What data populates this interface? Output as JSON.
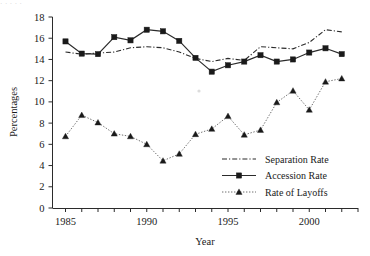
{
  "artifact": {
    "top_strip_text": "· ·                                                                    ·  ·                                                 ·"
  },
  "chart_data": {
    "type": "line",
    "title": "",
    "xlabel": "Year",
    "ylabel": "Percentages",
    "xlim": [
      1984.2,
      2003.0
    ],
    "ylim": [
      0,
      18
    ],
    "ytick_values": [
      0,
      2,
      4,
      6,
      8,
      10,
      12,
      14,
      16,
      18
    ],
    "ytick_labels": [
      "0",
      "2",
      "4",
      "6",
      "8",
      "10",
      "12",
      "14",
      "16",
      "18"
    ],
    "xtick_values": [
      1985,
      1986,
      1987,
      1988,
      1989,
      1990,
      1991,
      1992,
      1993,
      1994,
      1995,
      1996,
      1997,
      1998,
      1999,
      2000,
      2001,
      2002,
      2003
    ],
    "xtick_labels_shown": [
      {
        "value": 1985,
        "label": "1985"
      },
      {
        "value": 1990,
        "label": "1990"
      },
      {
        "value": 1995,
        "label": "1995"
      },
      {
        "value": 2000,
        "label": "2000"
      }
    ],
    "grid": false,
    "legend_position": "center-right",
    "x": [
      1985,
      1986,
      1987,
      1988,
      1989,
      1990,
      1991,
      1992,
      1993,
      1994,
      1995,
      1996,
      1997,
      1998,
      1999,
      2000,
      2001,
      2002
    ],
    "series": [
      {
        "name": "Separation Rate",
        "style": "dash-dot",
        "marker": "none",
        "color": "#2b2b2b",
        "values": [
          14.7,
          14.5,
          14.6,
          14.7,
          15.1,
          15.2,
          15.1,
          14.7,
          14.1,
          13.8,
          14.1,
          13.9,
          15.2,
          15.1,
          15.0,
          15.6,
          16.8,
          16.6
        ]
      },
      {
        "name": "Accession Rate",
        "style": "solid",
        "marker": "square",
        "color": "#1a1a1a",
        "values": [
          15.7,
          14.55,
          14.5,
          16.1,
          15.8,
          16.8,
          16.65,
          15.75,
          14.15,
          12.85,
          13.45,
          13.8,
          14.4,
          13.8,
          14.0,
          14.65,
          15.05,
          14.5
        ]
      },
      {
        "name": "Rate of Layoffs",
        "style": "dotted",
        "marker": "triangle",
        "color": "#6e6e6e",
        "values": [
          6.75,
          8.75,
          8.05,
          7.0,
          6.75,
          6.0,
          4.45,
          5.1,
          6.95,
          7.45,
          8.65,
          6.9,
          7.35,
          9.95,
          11.05,
          9.25,
          11.9,
          12.2
        ]
      }
    ]
  },
  "legend": {
    "items": [
      {
        "label": "Separation Rate",
        "style": "dash-dot",
        "marker": "none"
      },
      {
        "label": "Accession Rate",
        "style": "solid",
        "marker": "square"
      },
      {
        "label": "Rate of Layoffs",
        "style": "dotted",
        "marker": "triangle"
      }
    ]
  }
}
